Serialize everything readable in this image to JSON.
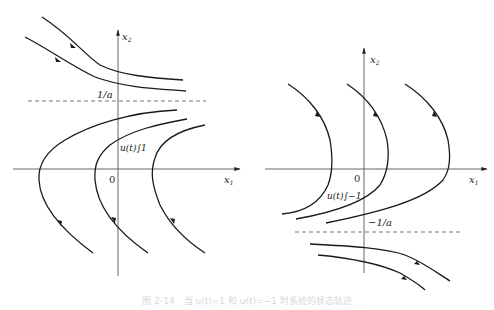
{
  "left_plot": {
    "x_axis_label": "x",
    "x_axis_sub": "1",
    "y_axis_label": "x",
    "y_axis_sub": "2",
    "origin_label": "0",
    "asymptote_label": "1/a",
    "control_label": "u(t)∫1"
  },
  "right_plot": {
    "x_axis_label": "x",
    "x_axis_sub": "1",
    "y_axis_label": "x",
    "y_axis_sub": "2",
    "origin_label": "0",
    "asymptote_label": "−1/a",
    "control_label": "u(t)∫−1"
  },
  "caption": "图 2-14　当 u(t)=1 和 u(t)=−1 时系统的状态轨迹",
  "colors": {
    "curve": "#1a1a1a",
    "axis": "#555555",
    "dashed": "#666666"
  }
}
